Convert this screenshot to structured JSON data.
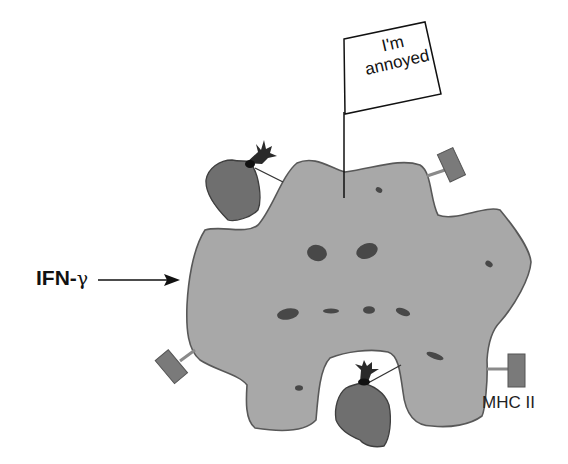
{
  "figure": {
    "type": "immunology-illustration"
  },
  "labels": {
    "ifn_prefix": "IFN-",
    "ifn_gamma": "γ",
    "mhc": "MHC II",
    "flag_line1": "I'm",
    "flag_line2": "annoyed"
  },
  "colors": {
    "cell_fill": "#a8a8a8",
    "cell_stroke": "#555555",
    "organelle_fill": "#4a4a4a",
    "bacteria_fill": "#6f6f6f",
    "mhc_fill": "#7a7a7a",
    "text": "#111111"
  }
}
